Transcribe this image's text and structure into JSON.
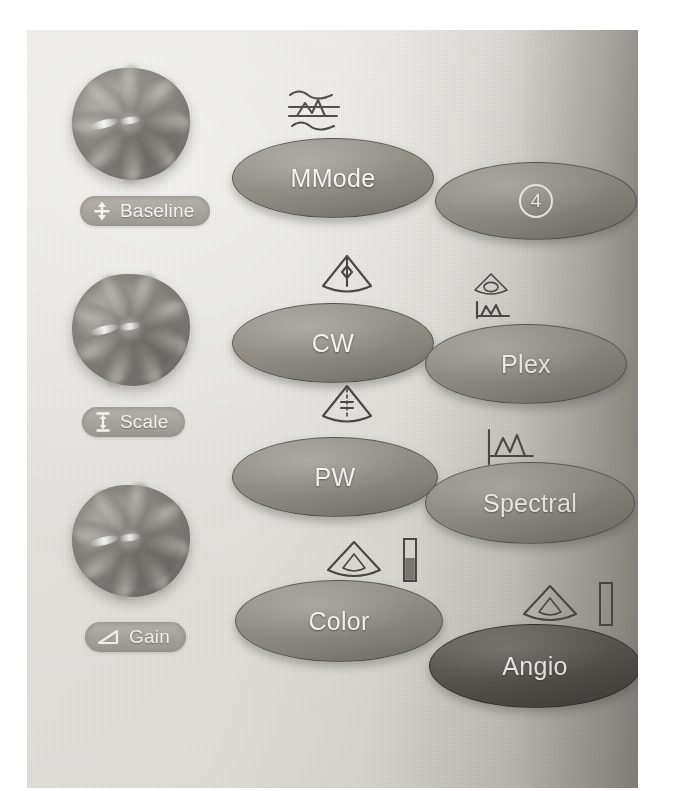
{
  "scene": {
    "description": "Photograph of an ultrasound scanner control panel section",
    "photo_background": "#e6e5e0",
    "panel_shadow_color": "#b4b1ab"
  },
  "knob_controls": [
    {
      "id": "baseline",
      "label": "Baseline",
      "icon": "baseline-shift-icon",
      "knob": "rotary-knob"
    },
    {
      "id": "scale",
      "label": "Scale",
      "icon": "scale-ibeam-icon",
      "knob": "rotary-knob"
    },
    {
      "id": "gain",
      "label": "Gain",
      "icon": "gain-wedge-icon",
      "knob": "rotary-knob"
    }
  ],
  "buttons": [
    {
      "id": "mmode",
      "label": "MMode",
      "icon": "mmode-waveform-icon",
      "style": "light",
      "column": "left"
    },
    {
      "id": "quad",
      "label": "4",
      "label_style": "circled-number",
      "icon": "none",
      "style": "light",
      "column": "right"
    },
    {
      "id": "cw",
      "label": "CW",
      "icon": "cw-sector-line-icon",
      "style": "light",
      "column": "left"
    },
    {
      "id": "plex",
      "label": "Plex",
      "icon": "plex-sector-trace-icon",
      "style": "light",
      "column": "right"
    },
    {
      "id": "pw",
      "label": "PW",
      "icon": "pw-sector-gate-icon",
      "style": "light",
      "column": "left"
    },
    {
      "id": "spectral",
      "label": "Spectral",
      "icon": "spectral-trace-icon",
      "style": "light",
      "column": "right"
    },
    {
      "id": "color",
      "label": "Color",
      "icon": "color-sector-icon",
      "secondary_icon": "color-bar-filled-icon",
      "style": "light",
      "column": "left"
    },
    {
      "id": "angio",
      "label": "Angio",
      "icon": "angio-sector-icon",
      "secondary_icon": "angio-bar-empty-icon",
      "style": "dark",
      "column": "right"
    }
  ],
  "colors": {
    "button_face": "#8f8c85",
    "button_face_dark": "#55524e",
    "button_text": "#f5f4f1",
    "pill_face": "#a7a49e",
    "pill_text": "#f4f3f0",
    "icon_ink": "#4a4845",
    "knob_body": "#8e8b85"
  }
}
